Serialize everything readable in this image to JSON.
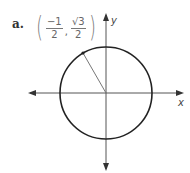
{
  "problem": {
    "label": "a."
  },
  "point": {
    "x": {
      "numerator": "−1",
      "denominator": "2"
    },
    "y": {
      "numerator": "√3",
      "denominator": "2"
    },
    "open_paren": "(",
    "close_paren": ")",
    "separator": ","
  },
  "axes": {
    "x_label": "x",
    "y_label": "y"
  },
  "diagram": {
    "type": "unit circle",
    "angle_degrees": 120,
    "colors": {
      "circle": "#222222",
      "axes": "#555555",
      "radius": "#777777"
    }
  }
}
